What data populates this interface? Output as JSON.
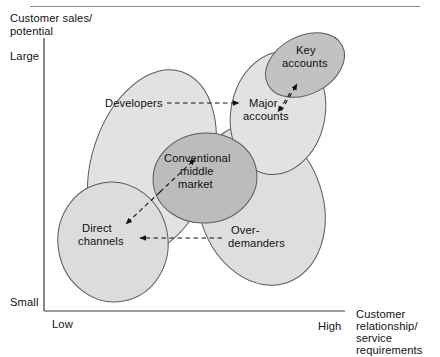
{
  "figure": {
    "axes": {
      "y_axis_title": "Customer sales/\npotential",
      "y_axis_title_line1": "Customer sales/",
      "y_axis_title_line2": "potential",
      "y_top_tick": "Large",
      "y_bottom_tick": "Small",
      "x_left_tick": "Low",
      "x_right_tick": "High",
      "x_axis_title_line1": "Customer",
      "x_axis_title_line2": "relationship/",
      "x_axis_title_line3": "service",
      "x_axis_title_line4": "requirements"
    },
    "bubbles": [
      {
        "id": "developers",
        "label": "Developers",
        "label_lines": [
          "Developers"
        ],
        "fill": "#e0e0e0",
        "stroke": "#555555"
      },
      {
        "id": "major-accounts",
        "label": "Major accounts",
        "label_lines": [
          "Major",
          "accounts"
        ],
        "fill": "#e0e0e0",
        "stroke": "#555555"
      },
      {
        "id": "key-accounts",
        "label": "Key accounts",
        "label_lines": [
          "Key",
          "accounts"
        ],
        "fill": "#c4c4c4",
        "stroke": "#555555"
      },
      {
        "id": "conventional-middle-market",
        "label": "Conventional middle market",
        "label_lines": [
          "Conventional",
          "middle",
          "market"
        ],
        "fill": "#bdbdbd",
        "stroke": "#555555"
      },
      {
        "id": "direct-channels",
        "label": "Direct channels",
        "label_lines": [
          "Direct",
          "channels"
        ],
        "fill": "#dcdcdc",
        "stroke": "#555555"
      },
      {
        "id": "over-demanders",
        "label": "Over-demanders",
        "label_lines": [
          "Over-",
          "demanders"
        ],
        "fill": "#dcdcdc",
        "stroke": "#555555"
      }
    ],
    "connectors": [
      {
        "id": "developers-to-major",
        "style": "dashed-arrow",
        "direction": "right"
      },
      {
        "id": "major-to-key",
        "style": "dashed-arrow",
        "direction": "up-right"
      },
      {
        "id": "direct-to-conventional",
        "style": "dashed-double-arrow",
        "direction": "diagonal"
      },
      {
        "id": "overdemanders-to-direct",
        "style": "dashed-arrow",
        "direction": "left"
      }
    ],
    "colors": {
      "axis": "#3a3a3a",
      "rule": "#8c8c8c",
      "text": "#111111",
      "light_fill": "#e0e0e0",
      "mid_fill": "#dcdcdc",
      "dark_fill": "#bdbdbd"
    }
  }
}
